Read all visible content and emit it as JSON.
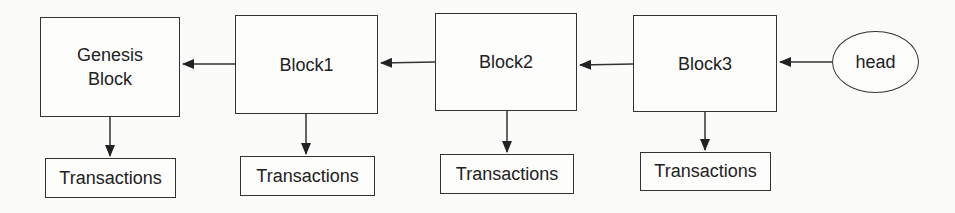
{
  "diagram": {
    "type": "blockchain-linked-list",
    "blocks": [
      {
        "id": "genesis",
        "label": "Genesis\nBlock",
        "transactions_label": "Transactions"
      },
      {
        "id": "block1",
        "label": "Block1",
        "transactions_label": "Transactions"
      },
      {
        "id": "block2",
        "label": "Block2",
        "transactions_label": "Transactions"
      },
      {
        "id": "block3",
        "label": "Block3",
        "transactions_label": "Transactions"
      }
    ],
    "head": {
      "label": "head"
    },
    "edges": [
      {
        "from": "head",
        "to": "block3"
      },
      {
        "from": "block3",
        "to": "block2"
      },
      {
        "from": "block2",
        "to": "block1"
      },
      {
        "from": "block1",
        "to": "genesis"
      },
      {
        "from": "genesis",
        "to": "genesis-transactions"
      },
      {
        "from": "block1",
        "to": "block1-transactions"
      },
      {
        "from": "block2",
        "to": "block2-transactions"
      },
      {
        "from": "block3",
        "to": "block3-transactions"
      }
    ],
    "colors": {
      "stroke": "#333333",
      "background": "#fbfbf9"
    }
  }
}
